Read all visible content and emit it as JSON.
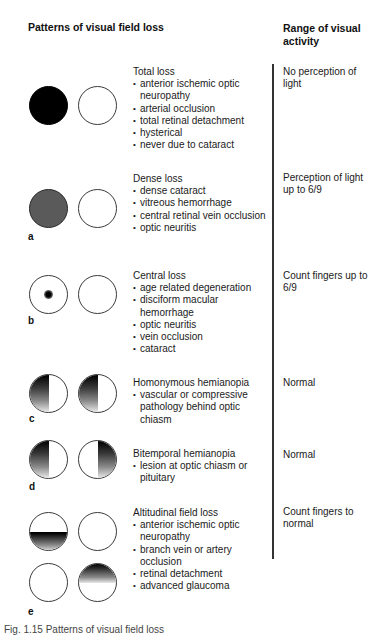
{
  "header": {
    "left_title": "Patterns of visual field loss",
    "right_title": "Range of visual activity"
  },
  "rows": [
    {
      "panel": "",
      "title": "Total loss",
      "bullets": [
        "anterior ischemic optic neuropathy",
        "arterial occlusion",
        "total retinal detachment",
        "hysterical",
        "never due to cataract"
      ],
      "range": "No perception of light",
      "left_eye": "fully black",
      "right_eye": "clear"
    },
    {
      "panel": "a",
      "title": "Dense loss",
      "bullets": [
        "dense cataract",
        "vitreous hemorrhage",
        "central retinal vein occlusion",
        "optic neuritis"
      ],
      "range": "Perception of light up to 6/9",
      "left_eye": "fully dark grey",
      "right_eye": "clear"
    },
    {
      "panel": "b",
      "title": "Central loss",
      "bullets": [
        "age related degeneration",
        "disciform macular hemorrhage",
        "optic neuritis",
        "vein occlusion",
        "cataract"
      ],
      "range": "Count fingers up to 6/9",
      "left_eye": "central scotoma",
      "right_eye": "clear"
    },
    {
      "panel": "c",
      "title": "Homonymous hemianopia",
      "bullets": [
        "vascular or compressive pathology behind optic chiasm"
      ],
      "range": "Normal",
      "left_eye": "left half loss",
      "right_eye": "left half loss"
    },
    {
      "panel": "d",
      "title": "Bitemporal hemianopia",
      "bullets": [
        "lesion at optic chiasm or pituitary"
      ],
      "range": "Normal",
      "left_eye": "left (temporal) half loss",
      "right_eye": "right (temporal) half loss"
    },
    {
      "panel": "e",
      "title": "Altitudinal field loss",
      "bullets": [
        "anterior ischemic optic neuropathy",
        "branch vein or artery occlusion",
        "retinal detachment",
        "advanced glaucoma"
      ],
      "range": "Count fingers to normal",
      "left_eye": "inferior half loss / clear",
      "right_eye": "clear / superior half loss"
    }
  ],
  "caption": "Fig. 1.15  Patterns of visual field loss"
}
